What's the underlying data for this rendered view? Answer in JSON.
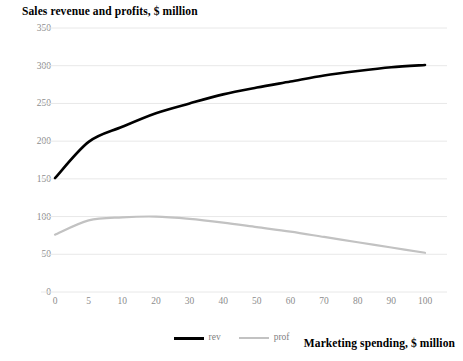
{
  "chart_data": {
    "type": "line",
    "title": "Sales revenue and profits, $ million",
    "xlabel": "Marketing spending, $ million",
    "ylabel": "",
    "categories": [
      "0",
      "5",
      "10",
      "20",
      "30",
      "40",
      "50",
      "60",
      "70",
      "80",
      "90",
      "100"
    ],
    "series": [
      {
        "name": "rev",
        "color": "#000000",
        "width": 2.6,
        "values": [
          151,
          199,
          219,
          237,
          250,
          262,
          271,
          279,
          287,
          293,
          298,
          301
        ]
      },
      {
        "name": "prof",
        "color": "#c2c2c2",
        "width": 2.2,
        "values": [
          76,
          95,
          99,
          100,
          97,
          92,
          86,
          80,
          73,
          66,
          59,
          52
        ]
      }
    ],
    "ylim": [
      0,
      350
    ],
    "yticks": [
      0,
      50,
      100,
      150,
      200,
      250,
      300,
      350
    ],
    "ytick_labels": [
      "0",
      "50",
      "100",
      "150",
      "200",
      "250",
      "300",
      "350"
    ],
    "grid": true,
    "grid_color": "#e8e8e8",
    "legend_position": "bottom",
    "legend_entries": [
      {
        "label": "rev",
        "color": "#000000"
      },
      {
        "label": "prof",
        "color": "#c2c2c2"
      }
    ]
  }
}
